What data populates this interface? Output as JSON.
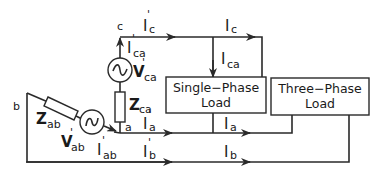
{
  "diagram": {
    "type": "circuit",
    "nodes": {
      "a": "a",
      "b": "b",
      "c": "c"
    },
    "loads": {
      "single_phase": {
        "line1": "Single−Phase",
        "line2": "Load"
      },
      "three_phase": {
        "line1": "Three−Phase",
        "line2": "Load"
      }
    },
    "labels": {
      "Ic_prime": {
        "main": "I",
        "prime": "'",
        "sub": "c"
      },
      "Ic": {
        "main": "I",
        "sub": "c"
      },
      "Ica": {
        "main": "I",
        "sub": "ca"
      },
      "Ica_prime": {
        "main": "I",
        "prime": "'",
        "sub": "ca"
      },
      "Vca_prime": {
        "main": "V",
        "prime": "'",
        "sub": "ca"
      },
      "Zca": {
        "main": "Z",
        "sub": "ca"
      },
      "Zab": {
        "main": "Z",
        "sub": "ab"
      },
      "Vab_prime": {
        "main": "V",
        "prime": "'",
        "sub": "ab"
      },
      "Iab_prime": {
        "main": "I",
        "prime": "'",
        "sub": "ab"
      },
      "Ia_prime": {
        "main": "I",
        "prime": "'",
        "sub": "a"
      },
      "Ia": {
        "main": "I",
        "sub": "a"
      },
      "Ib_prime": {
        "main": "I",
        "prime": "'",
        "sub": "b"
      },
      "Ib": {
        "main": "I",
        "sub": "b"
      }
    },
    "colors": {
      "line": "#2a2a2a",
      "background": "#ffffff"
    }
  }
}
